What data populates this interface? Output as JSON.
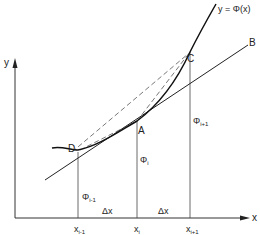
{
  "diagram": {
    "axes": {
      "x_label": "x",
      "y_label": "y"
    },
    "curve_label": "y = Φ(x)",
    "points": {
      "D": "D",
      "A": "A",
      "C": "C",
      "B": "B"
    },
    "grid_labels": {
      "x_im1": "x",
      "x_im1_sub": "i-1",
      "x_i": "x",
      "x_i_sub": "i",
      "x_ip1": "x",
      "x_ip1_sub": "i+1"
    },
    "ordinates": {
      "phi_im1": "Φ",
      "phi_im1_sub": "i-1",
      "phi_i": "Φ",
      "phi_i_sub": "i",
      "phi_ip1": "Φ",
      "phi_ip1_sub": "i+1"
    },
    "spacing": {
      "dx1": "Δx",
      "dx2": "Δx"
    },
    "colors": {
      "ink": "#222222",
      "background": "#ffffff"
    }
  }
}
